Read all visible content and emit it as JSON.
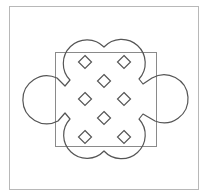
{
  "figure": {
    "width": 206,
    "height": 195,
    "background": "#ffffff",
    "frame": {
      "x": 9,
      "y": 6,
      "width": 189,
      "height": 183,
      "stroke": "#b8b8b8",
      "stroke_width": 1
    },
    "square": {
      "x": 55,
      "y": 52,
      "width": 101,
      "height": 94,
      "stroke": "#8a8a8a",
      "stroke_width": 1
    },
    "outline": {
      "stroke": "#555555",
      "stroke_width": 1.2,
      "description": "four-lobed cloud shape with left and right circular ears joined by small notches",
      "path": "M 104 47 A 23 23 0 1 1 139 79 L 143 84 L 152 78 A 24 24 0 1 1 155 121 L 143 114 L 139 119 A 23 23 0 1 1 104 151 A 23 23 0 1 1 70 119 L 65 113 L 58 121 A 24 24 0 1 1 57 78 L 65 86 L 70 80 A 23 23 0 1 1 104 47 Z"
    },
    "diamonds": {
      "half_size": 6.5,
      "stroke": "#555555",
      "stroke_width": 1.2,
      "items": [
        {
          "cx": 85,
          "cy": 62
        },
        {
          "cx": 124,
          "cy": 62
        },
        {
          "cx": 104,
          "cy": 81
        },
        {
          "cx": 85,
          "cy": 99
        },
        {
          "cx": 124,
          "cy": 99
        },
        {
          "cx": 104,
          "cy": 118
        },
        {
          "cx": 85,
          "cy": 137
        },
        {
          "cx": 124,
          "cy": 137
        }
      ]
    }
  }
}
